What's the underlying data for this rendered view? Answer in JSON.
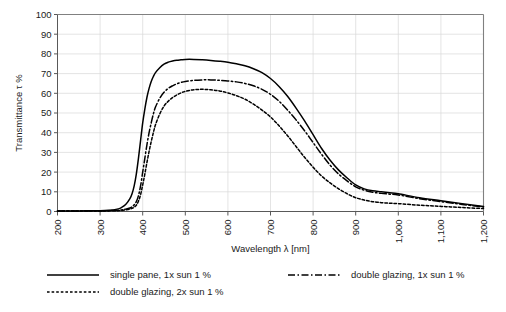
{
  "chart_data": {
    "type": "line",
    "title": "",
    "xlabel": "Wavelength  λ [nm]",
    "ylabel": "Transmittance τ %",
    "xlim": [
      200,
      1200
    ],
    "ylim": [
      0,
      100
    ],
    "grid": true,
    "legend_position": "bottom",
    "xticks": [
      200,
      300,
      400,
      500,
      600,
      700,
      800,
      900,
      1000,
      1100,
      1200
    ],
    "xticklabels": [
      "200",
      "300",
      "400",
      "500",
      "600",
      "700",
      "800",
      "900",
      "1,000",
      "1,100",
      "1,200"
    ],
    "xtick_rotation": 90,
    "yticks": [
      0,
      10,
      20,
      30,
      40,
      50,
      60,
      70,
      80,
      90,
      100
    ],
    "yticklabels": [
      "0",
      "10",
      "20",
      "30",
      "40",
      "50",
      "60",
      "70",
      "80",
      "90",
      "100"
    ],
    "x": [
      200,
      250,
      300,
      320,
      340,
      350,
      360,
      370,
      375,
      380,
      385,
      390,
      395,
      400,
      405,
      410,
      415,
      420,
      425,
      430,
      440,
      450,
      460,
      470,
      480,
      490,
      500,
      520,
      540,
      560,
      580,
      600,
      620,
      640,
      660,
      680,
      700,
      720,
      740,
      760,
      780,
      800,
      820,
      840,
      860,
      880,
      900,
      920,
      940,
      960,
      980,
      1000,
      1050,
      1100,
      1150,
      1200
    ],
    "series": [
      {
        "name": "single pane, 1x sun 1 %",
        "style": "solid",
        "values": [
          0.3,
          0.3,
          0.4,
          0.6,
          1.2,
          2.0,
          3.5,
          6.5,
          9.0,
          13.0,
          19.0,
          27.0,
          36.0,
          45.0,
          52.0,
          58.0,
          62.5,
          66.0,
          68.5,
          70.5,
          73.0,
          74.8,
          75.8,
          76.4,
          76.8,
          77.0,
          77.2,
          77.2,
          77.0,
          76.7,
          76.3,
          75.8,
          75.0,
          74.0,
          72.5,
          70.5,
          67.5,
          63.5,
          58.5,
          52.5,
          46.0,
          39.0,
          32.0,
          26.0,
          21.0,
          17.0,
          13.5,
          11.5,
          10.5,
          10.0,
          9.5,
          9.0,
          7.0,
          5.5,
          4.0,
          2.5
        ]
      },
      {
        "name": "double glazing, 1x sun 1 %",
        "style": "dashdot",
        "values": [
          0.2,
          0.2,
          0.3,
          0.4,
          0.6,
          0.8,
          1.2,
          1.8,
          2.4,
          3.4,
          5.0,
          8.0,
          13.0,
          20.0,
          27.0,
          34.0,
          40.0,
          45.0,
          49.5,
          53.0,
          57.5,
          60.5,
          62.5,
          63.8,
          64.8,
          65.5,
          66.0,
          66.6,
          66.8,
          66.8,
          66.6,
          66.3,
          65.8,
          65.0,
          63.8,
          62.0,
          59.5,
          56.0,
          51.5,
          46.5,
          41.0,
          35.0,
          29.0,
          23.5,
          19.0,
          15.5,
          12.5,
          10.8,
          9.8,
          9.2,
          8.8,
          8.4,
          6.5,
          5.0,
          3.6,
          2.3
        ]
      },
      {
        "name": "double glazing, 2x sun 1 %",
        "style": "dotted",
        "values": [
          0.2,
          0.2,
          0.2,
          0.3,
          0.4,
          0.5,
          0.8,
          1.2,
          1.6,
          2.2,
          3.2,
          5.2,
          8.5,
          13.5,
          19.0,
          25.0,
          30.5,
          35.5,
          40.0,
          44.0,
          49.5,
          53.5,
          56.0,
          57.8,
          59.2,
          60.2,
          61.0,
          61.8,
          62.0,
          61.8,
          61.2,
          60.2,
          58.8,
          57.0,
          54.5,
          51.5,
          48.0,
          43.5,
          38.5,
          33.0,
          27.5,
          22.5,
          18.0,
          14.5,
          11.5,
          9.0,
          7.0,
          5.8,
          5.0,
          4.5,
          4.2,
          4.0,
          3.2,
          2.6,
          2.0,
          1.5
        ]
      }
    ]
  },
  "legend": {
    "items": [
      {
        "label": "single pane, 1x sun 1 %",
        "style": "solid"
      },
      {
        "label": "double glazing, 1x sun 1 %",
        "style": "dashdot"
      },
      {
        "label": "double glazing, 2x sun 1 %",
        "style": "dotted"
      }
    ]
  },
  "axes": {
    "x_title": "Wavelength  λ [nm]",
    "y_title": "Transmittance τ %"
  }
}
